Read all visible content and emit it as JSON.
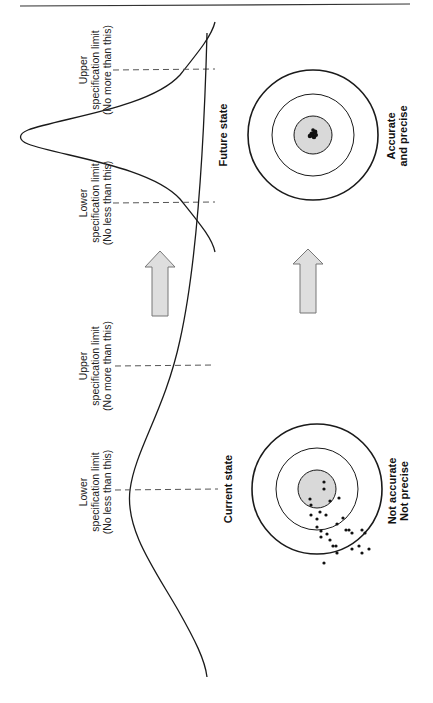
{
  "diagram": {
    "orientation": "rotated-90-ccw",
    "colors": {
      "line": "#1a1a1a",
      "dashed": "#555555",
      "fill_gray": "#d9d9d9",
      "arrow_fill": "#dedede",
      "arrow_stroke": "#777777"
    },
    "future_state": {
      "title": "Future state",
      "usl_label": [
        "Upper",
        "specification limit",
        "(No more than this)"
      ],
      "lsl_label": [
        "Lower",
        "specification limit",
        "(No less than this)"
      ],
      "target_caption": [
        "Accurate",
        "and precise"
      ]
    },
    "current_state": {
      "title": "Current state",
      "usl_label": [
        "Upper",
        "specification limit",
        "(No more than this)"
      ],
      "lsl_label": [
        "Lower",
        "specification limit",
        "(No less than this)"
      ],
      "target_caption": [
        "Not accurate",
        "Not precise"
      ]
    },
    "arrows": [
      {
        "name": "distribution-improvement-arrow",
        "direction": "up"
      },
      {
        "name": "target-improvement-arrow",
        "direction": "up"
      }
    ]
  }
}
